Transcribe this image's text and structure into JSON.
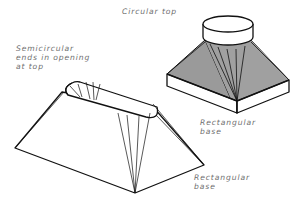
{
  "diagram": {
    "labels": {
      "circular_top": "Circular top",
      "semicircular_line1": "Semicircular",
      "semicircular_line2": "ends in opening",
      "semicircular_line3": "at top",
      "rect_base_right_line1": "Rectangular",
      "rect_base_right_line2": "base",
      "rect_base_left_line1": "Rectangular",
      "rect_base_left_line2": "base"
    },
    "colors": {
      "line": "#111111",
      "shade": "#9a9a9a",
      "label": "#6e6e6e",
      "background": "#ffffff"
    }
  }
}
